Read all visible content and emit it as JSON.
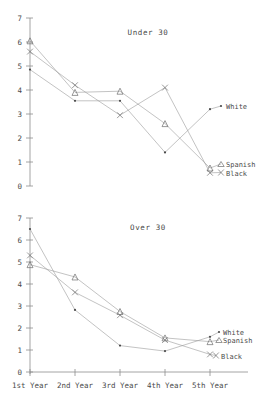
{
  "chart_data": [
    {
      "type": "line",
      "title": "Under 30",
      "xlabel": "",
      "ylabel": "",
      "categories": [
        "1st Year",
        "2nd Year",
        "3rd Year",
        "4th Year",
        "5th Year"
      ],
      "xticklabels": [
        "1st Year",
        "2nd Year",
        "3rd Year",
        "4th Year",
        "5th Year"
      ],
      "yticklabels": [
        "0",
        "1",
        "2",
        "3",
        "4",
        "5",
        "6",
        "7"
      ],
      "ylim": [
        0,
        7
      ],
      "grid": false,
      "legend_position": "right-inline",
      "series": [
        {
          "name": "White",
          "marker": "dot",
          "values": [
            4.85,
            3.55,
            3.55,
            1.4,
            3.2
          ]
        },
        {
          "name": "Spanish",
          "marker": "triangle",
          "values": [
            6.05,
            3.9,
            3.95,
            2.6,
            0.75
          ]
        },
        {
          "name": "Black",
          "marker": "x",
          "values": [
            5.6,
            4.2,
            2.95,
            4.1,
            0.55
          ]
        }
      ]
    },
    {
      "type": "line",
      "title": "Over 30",
      "xlabel": "",
      "ylabel": "",
      "categories": [
        "1st Year",
        "2nd Year",
        "3rd Year",
        "4th Year",
        "5th Year"
      ],
      "xticklabels": [
        "1st Year",
        "2nd Year",
        "3rd Year",
        "4th Year",
        "5th Year"
      ],
      "yticklabels": [
        "0",
        "1",
        "2",
        "3",
        "4",
        "5",
        "6",
        "7"
      ],
      "ylim": [
        0,
        7
      ],
      "grid": false,
      "legend_position": "right-inline",
      "series": [
        {
          "name": "White",
          "marker": "dot",
          "values": [
            6.5,
            2.82,
            1.2,
            0.95,
            1.6
          ]
        },
        {
          "name": "Spanish",
          "marker": "triangle",
          "values": [
            4.88,
            4.32,
            2.75,
            1.55,
            1.38
          ]
        },
        {
          "name": "Black",
          "marker": "x",
          "values": [
            5.3,
            3.62,
            2.58,
            1.45,
            0.8
          ]
        }
      ]
    }
  ],
  "charts": {
    "under30": {
      "title": "Under 30",
      "yticks": [
        "7",
        "6",
        "5",
        "4",
        "3",
        "2",
        "1",
        "0"
      ],
      "legend": {
        "white": "White",
        "spanish": "Spanish",
        "black": "Black"
      }
    },
    "over30": {
      "title": "Over 30",
      "yticks": [
        "7",
        "6",
        "5",
        "4",
        "3",
        "2",
        "1",
        "0"
      ],
      "xticks": [
        "1st Year",
        "2nd Year",
        "3rd Year",
        "4th Year",
        "5th Year"
      ],
      "legend": {
        "white": "White",
        "spanish": "Spanish",
        "black": "Black"
      }
    }
  }
}
